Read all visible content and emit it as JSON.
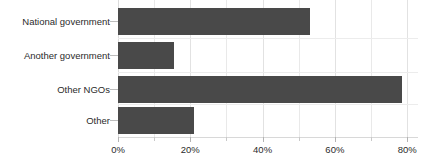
{
  "chart_data": {
    "type": "bar",
    "orientation": "horizontal",
    "title": "",
    "subtitle": "",
    "xlabel": "",
    "ylabel": "",
    "categories": [
      "National government",
      "Another government",
      "Other NGOs",
      "Other"
    ],
    "values": [
      53,
      15.5,
      78.5,
      21
    ],
    "value_suffix": "%",
    "xlim": [
      0,
      83
    ],
    "xticks": [
      0,
      20,
      40,
      60,
      80
    ],
    "xtick_labels": [
      "0%",
      "20%",
      "40%",
      "60%",
      "80%"
    ],
    "minor_gridlines": [
      10,
      30,
      50,
      70
    ],
    "grid": true,
    "legend": null,
    "series": [
      {
        "name": "",
        "values": [
          53,
          15.5,
          78.5,
          21
        ]
      }
    ],
    "colors": {
      "bar": "#494949",
      "gridline": "#e9e9e9",
      "axis": "#d8d8d8",
      "text": "#2b2b2b",
      "background": "#ffffff"
    }
  }
}
